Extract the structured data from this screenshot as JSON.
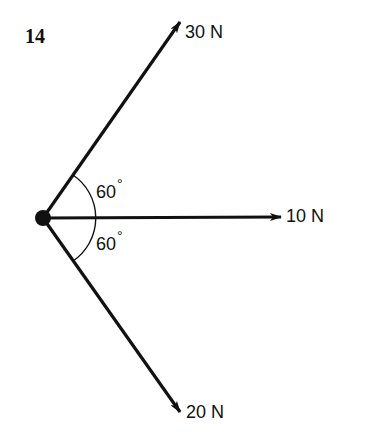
{
  "problem": {
    "number": "14"
  },
  "origin": {
    "x": 43,
    "y": 218
  },
  "vectors": [
    {
      "id": "upper",
      "magnitude_label": "30 N",
      "angle_deg": 60,
      "direction": "up-right",
      "tip": {
        "x": 180,
        "y": 22
      }
    },
    {
      "id": "horizontal",
      "magnitude_label": "10 N",
      "angle_deg": 0,
      "direction": "right",
      "tip": {
        "x": 281,
        "y": 217
      }
    },
    {
      "id": "lower",
      "magnitude_label": "20 N",
      "angle_deg": -60,
      "direction": "down-right",
      "tip": {
        "x": 180,
        "y": 412
      }
    }
  ],
  "angles": {
    "upper": {
      "value": "60",
      "symbol": "°"
    },
    "lower": {
      "value": "60",
      "symbol": "°"
    }
  },
  "colors": {
    "stroke": "#111111",
    "background": "#ffffff"
  }
}
